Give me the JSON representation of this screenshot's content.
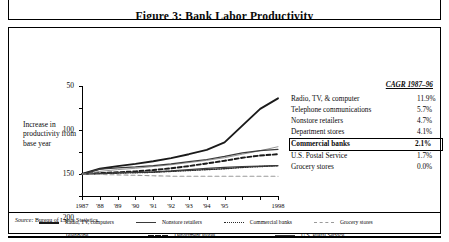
{
  "title": "Figure 3:  Bank Labor Productivity",
  "axis": {
    "ylabel": "Increase in productivity from base year",
    "yticks": [
      "300",
      "250",
      "200",
      "150",
      "100",
      "50"
    ],
    "xticks": [
      "1987",
      "'88",
      "'89",
      "'90",
      "'91",
      "'92",
      "'93",
      "'94",
      "'95",
      "1998"
    ]
  },
  "cagr": {
    "header": "CAGR 1987–96",
    "rows": [
      {
        "name": "Radio, TV, & computer",
        "value": "11.9%",
        "highlight": false
      },
      {
        "name": "Telephone communications",
        "value": "5.7%",
        "highlight": false
      },
      {
        "name": "Nonstore retailers",
        "value": "4.7%",
        "highlight": false
      },
      {
        "name": "Department stores",
        "value": "4.1%",
        "highlight": false
      },
      {
        "name": "Commercial banks",
        "value": "2.1%",
        "highlight": true
      },
      {
        "name": "U.S. Postal Service",
        "value": "1.7%",
        "highlight": false
      },
      {
        "name": "Grocery stores",
        "value": "0.0%",
        "highlight": false
      }
    ]
  },
  "key": {
    "row1": [
      {
        "label": "Radio, TV, computers",
        "style": "solid-thick"
      },
      {
        "label": "Nonstore retailers",
        "style": "solid-med"
      },
      {
        "label": "Commercial banks",
        "style": "dotted"
      },
      {
        "label": "Grocery stores",
        "style": "dashed-lt"
      }
    ],
    "row2": [
      {
        "label": "Telephone",
        "style": "solid-thin"
      },
      {
        "label": "Department stores",
        "style": "dashed-dk"
      },
      {
        "label": "U.S. Postal Service",
        "style": "solid-med"
      }
    ]
  },
  "source": {
    "label": "Source:",
    "text": "Bureau of Labor Statistics"
  },
  "chart_data": {
    "type": "line",
    "title": "Figure 3:  Bank Labor Productivity",
    "xlabel": "",
    "ylabel": "Increase in productivity from base year",
    "x": [
      1987,
      1988,
      1989,
      1990,
      1991,
      1992,
      1993,
      1994,
      1995,
      1996,
      1997,
      1998
    ],
    "xtick_labels": [
      "1987",
      "'88",
      "'89",
      "'90",
      "'91",
      "'92",
      "'93",
      "'94",
      "'95",
      "1998"
    ],
    "ylim": [
      50,
      300
    ],
    "yticks": [
      50,
      100,
      150,
      200,
      250,
      300
    ],
    "grid": false,
    "legend": "bottom",
    "series": [
      {
        "name": "Radio, TV, computers",
        "cagr": "11.9%",
        "color": "#1a1a1a",
        "style": "solid-thick",
        "values": [
          100,
          112,
          118,
          123,
          129,
          136,
          145,
          155,
          172,
          210,
          248,
          272
        ]
      },
      {
        "name": "Telephone",
        "cagr": "5.7%",
        "color": "#8a8a8a",
        "style": "solid-thin",
        "values": [
          100,
          106,
          110,
          113,
          117,
          121,
          126,
          131,
          137,
          145,
          153,
          162
        ]
      },
      {
        "name": "Nonstore retailers",
        "cagr": "4.7%",
        "color": "#3a3a3a",
        "style": "solid-med",
        "values": [
          100,
          111,
          114,
          116,
          119,
          123,
          128,
          133,
          140,
          148,
          153,
          156
        ]
      },
      {
        "name": "Department stores",
        "cagr": "4.1%",
        "color": "#1a1a1a",
        "style": "dashed-dk",
        "values": [
          100,
          102,
          104,
          106,
          109,
          113,
          118,
          124,
          130,
          137,
          142,
          145
        ]
      },
      {
        "name": "Commercial banks",
        "cagr": "2.1%",
        "color": "#2b2b2b",
        "style": "dotted",
        "values": [
          100,
          101,
          102,
          103,
          104,
          106,
          108,
          110,
          112,
          115,
          117,
          119
        ]
      },
      {
        "name": "U.S. Postal Service",
        "cagr": "1.7%",
        "color": "#3a3a3a",
        "style": "solid-med",
        "values": [
          100,
          101,
          103,
          104,
          105,
          107,
          110,
          113,
          115,
          117,
          118,
          119
        ]
      },
      {
        "name": "Grocery stores",
        "cagr": "0.0%",
        "color": "#9a9a9a",
        "style": "dashed-lt",
        "values": [
          100,
          99,
          98,
          97,
          96,
          95,
          95,
          95,
          95,
          95,
          95,
          95
        ]
      }
    ]
  }
}
